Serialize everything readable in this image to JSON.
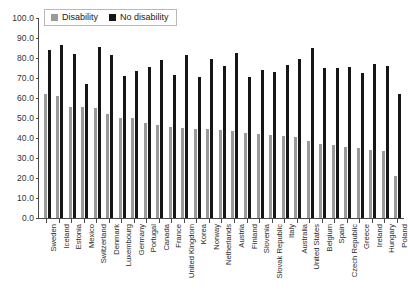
{
  "legend": {
    "position": "top-left",
    "items": [
      {
        "label": "Disability",
        "color": "#9a9a9a",
        "key": "disability"
      },
      {
        "label": "No disability",
        "color": "#161616",
        "key": "no_disability"
      }
    ]
  },
  "axis": {
    "y_ticks": [
      "0.0",
      "10.0",
      "20.0",
      "30.0",
      "40.0",
      "50.0",
      "60.0",
      "70.0",
      "80.0",
      "90.0",
      "100.0"
    ]
  },
  "chart_data": {
    "type": "bar",
    "title": "",
    "subtitle": "",
    "xlabel": "",
    "ylabel": "",
    "ylim": [
      0,
      100
    ],
    "ytick_step": 10,
    "grid": false,
    "legend_position": "top-left",
    "categories": [
      "Sweden",
      "Iceland",
      "Estonia",
      "Mexico",
      "Switzerland",
      "Denmark",
      "Luxembourg",
      "Germany",
      "Portugal",
      "Canada",
      "France",
      "United Kingdom",
      "Korea",
      "Norway",
      "Netherlands",
      "Austria",
      "Finland",
      "Slovenia",
      "Slovak Republic",
      "Italy",
      "Australia",
      "United States",
      "Belgium",
      "Spain",
      "Czech Republic",
      "Greece",
      "Ireland",
      "Hungary",
      "Poland"
    ],
    "series": [
      {
        "name": "Disability",
        "color": "#9a9a9a",
        "values": [
          62.0,
          61.0,
          55.7,
          55.4,
          54.8,
          51.8,
          49.8,
          50.0,
          47.5,
          46.6,
          45.6,
          45.0,
          44.3,
          44.7,
          44.0,
          43.4,
          42.4,
          42.0,
          41.4,
          41.0,
          40.3,
          38.5,
          37.0,
          36.3,
          35.6,
          35.0,
          34.0,
          33.5,
          21.0
        ]
      },
      {
        "name": "No disability",
        "color": "#161616",
        "values": [
          84.0,
          86.3,
          82.0,
          66.8,
          85.5,
          81.6,
          71.2,
          73.3,
          75.3,
          78.8,
          71.4,
          81.5,
          70.3,
          79.5,
          76.0,
          82.7,
          70.7,
          74.2,
          72.8,
          76.7,
          79.3,
          85.0,
          74.8,
          75.2,
          75.4,
          72.4,
          77.0,
          75.8,
          62.0
        ]
      }
    ]
  }
}
